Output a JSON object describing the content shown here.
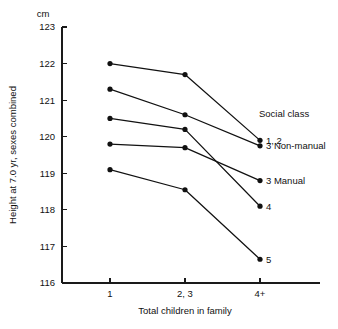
{
  "chart_data": {
    "type": "line",
    "title": "",
    "xlabel": "Total children in family",
    "ylabel": "Height at 7.0 yr, sexes combined",
    "yunit": "cm",
    "categories": [
      "1",
      "2, 3",
      "4+"
    ],
    "ylim": [
      116,
      123
    ],
    "yticks": [
      "116",
      "117",
      "118",
      "119",
      "120",
      "121",
      "122",
      "123"
    ],
    "grid": false,
    "legend_position": "right-inline",
    "legend_title": "Social class",
    "series": [
      {
        "name": "1, 2",
        "values": [
          122.0,
          121.7,
          119.9
        ]
      },
      {
        "name": "3 Non-manual",
        "values": [
          121.3,
          120.6,
          119.75
        ]
      },
      {
        "name": "4",
        "values": [
          120.5,
          120.2,
          118.1
        ]
      },
      {
        "name": "3 Manual",
        "values": [
          119.8,
          119.7,
          118.8
        ]
      },
      {
        "name": "5",
        "values": [
          119.1,
          118.55,
          116.65
        ]
      }
    ]
  },
  "colors": {
    "ink": "#111111",
    "background": "#ffffff"
  }
}
